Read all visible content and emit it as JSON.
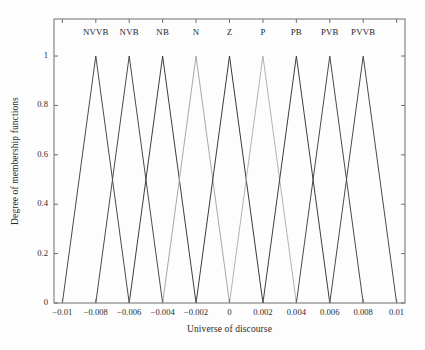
{
  "chart_data": {
    "type": "line",
    "title": "",
    "xlabel": "Universe of discourse",
    "ylabel": "Degree of membership functions",
    "xlim": [
      -0.0105,
      0.0105
    ],
    "ylim": [
      0,
      1.15
    ],
    "grid": false,
    "legend_position": "inline-above-peaks",
    "xticks": [
      -0.01,
      -0.008,
      -0.006,
      -0.004,
      -0.002,
      0,
      0.002,
      0.004,
      0.006,
      0.008,
      0.01
    ],
    "xticklabels": [
      "−0.01",
      "−0.008",
      "−0.006",
      "−0.004",
      "−0.002",
      "0",
      "0.002",
      "0.004",
      "0.006",
      "0.008",
      "0.01"
    ],
    "yticks": [
      0,
      0.2,
      0.4,
      0.6,
      0.8,
      1
    ],
    "yticklabels": [
      "0",
      "0.2",
      "0.4",
      "0.6",
      "0.8",
      "1"
    ],
    "series": [
      {
        "name": "NVVB",
        "peak": -0.008,
        "left": -0.01,
        "right": -0.006,
        "values": [
          0,
          1,
          0
        ],
        "x": [
          -0.01,
          -0.008,
          -0.006
        ],
        "color": "#4a4a4a"
      },
      {
        "name": "NVB",
        "peak": -0.006,
        "left": -0.008,
        "right": -0.004,
        "values": [
          0,
          1,
          0
        ],
        "x": [
          -0.008,
          -0.006,
          -0.004
        ],
        "color": "#4a4a4a"
      },
      {
        "name": "NB",
        "peak": -0.004,
        "left": -0.006,
        "right": -0.002,
        "values": [
          0,
          1,
          0
        ],
        "x": [
          -0.006,
          -0.004,
          -0.002
        ],
        "color": "#3d3d3d"
      },
      {
        "name": "N",
        "peak": -0.002,
        "left": -0.004,
        "right": 0.0,
        "values": [
          0,
          1,
          0
        ],
        "x": [
          -0.004,
          -0.002,
          0
        ],
        "color": "#a9a9a9"
      },
      {
        "name": "Z",
        "peak": 0.0,
        "left": -0.002,
        "right": 0.002,
        "values": [
          0,
          1,
          0
        ],
        "x": [
          -0.002,
          0,
          0.002
        ],
        "color": "#3a3a3a"
      },
      {
        "name": "P",
        "peak": 0.002,
        "left": 0.0,
        "right": 0.004,
        "values": [
          0,
          1,
          0
        ],
        "x": [
          0,
          0.002,
          0.004
        ],
        "color": "#b4b4b4"
      },
      {
        "name": "PB",
        "peak": 0.004,
        "left": 0.002,
        "right": 0.006,
        "values": [
          0,
          1,
          0
        ],
        "x": [
          0.002,
          0.004,
          0.006
        ],
        "color": "#3d3d3d"
      },
      {
        "name": "PVB",
        "peak": 0.006,
        "left": 0.004,
        "right": 0.008,
        "values": [
          0,
          1,
          0
        ],
        "x": [
          0.004,
          0.006,
          0.008
        ],
        "color": "#4a4a4a"
      },
      {
        "name": "PVVB",
        "peak": 0.008,
        "left": 0.006,
        "right": 0.01,
        "values": [
          0,
          1,
          0
        ],
        "x": [
          0.006,
          0.008,
          0.01
        ],
        "color": "#4a4a4a"
      }
    ],
    "series_label_y": 1.09,
    "axis_color": "#6e6e6e",
    "text_color": "#2a2a2a",
    "background_color": "#fdfdfd"
  },
  "plot_box": {
    "left": 54,
    "top": 19,
    "right": 405,
    "bottom": 303
  }
}
